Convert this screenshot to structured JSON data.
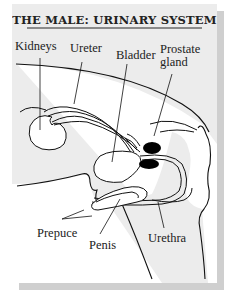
{
  "title": "THE MALE: URINARY SYSTEM",
  "labels": {
    "kidneys": "Kidneys",
    "ureter": "Ureter",
    "bladder": "Bladder",
    "prostate": "Prostate\ngland",
    "prepuce": "Prepuce",
    "penis": "Penis",
    "urethra": "Urethra"
  },
  "colors": {
    "card_bg": "#ececec",
    "shadow": "#cfcfcf",
    "body_interior": "#ffffff",
    "line": "#111111",
    "prostate_fill": "#000000"
  }
}
